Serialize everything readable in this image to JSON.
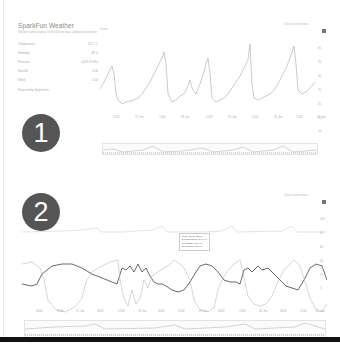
{
  "sidebar": {
    "title": "SparkFun Weather",
    "subtitle": "Weather station readings for the last few days, updated every minute",
    "rows": [
      {
        "label": "Temperature",
        "value": "22.1 °C"
      },
      {
        "label": "Humidity",
        "value": "48 %"
      },
      {
        "label": "Pressure",
        "value": "1013.25 hPa"
      },
      {
        "label": "Rainfall",
        "value": "0.00"
      },
      {
        "label": "Wind",
        "value": "3.10"
      }
    ],
    "powered": "Powered by Highcharts"
  },
  "badges": {
    "first": "1",
    "second": "2"
  },
  "chart1": {
    "panel_title": "Zoom",
    "export_link": "Chart context menu",
    "y_ticks": [
      "40",
      "35",
      "30",
      "25",
      "20",
      "15",
      "10"
    ],
    "x_ticks": [
      "12:00",
      "27. Jan",
      "12:00",
      "28. Jan",
      "12:00",
      "29. Jan",
      "12:00",
      "30. Jan",
      "12:00",
      "31. Jan"
    ]
  },
  "chart2": {
    "export_link": "Chart context menu",
    "y_ticks": [
      "100",
      "80",
      "60",
      "40",
      "20",
      "0"
    ],
    "x_ticks": [
      "06:00",
      "12:00",
      "27. Jan",
      "06:00",
      "12:00",
      "28. Jan",
      "06:00",
      "12:00",
      "29. Jan",
      "06:00",
      "12:00",
      "30. Jan",
      "06:00",
      "12:00",
      "31. Jan"
    ],
    "tooltip": {
      "header": "Wed, Jan 29 12:00",
      "line1": "● Temperature: 34.1 °C",
      "line2": "● Humidity: 58.0 %",
      "line3": "● Pressure: 78.0 %"
    }
  }
}
